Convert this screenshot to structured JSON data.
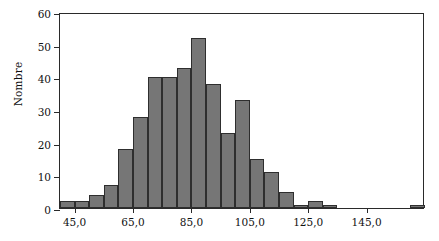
{
  "chart_data": {
    "type": "bar",
    "title": "",
    "subtitle": "",
    "xlabel": "",
    "ylabel": "Nombre",
    "grid": false,
    "legend": false,
    "legend_position": "none",
    "bar_color": "#767676",
    "bar_edge_color": "#2e2e2e",
    "axis_color": "#2a2a2a",
    "xlim": [
      40.0,
      165.0
    ],
    "ylim": [
      0,
      60
    ],
    "bin_width": 5.0,
    "y_ticks": [
      0,
      10,
      20,
      30,
      40,
      50,
      60
    ],
    "y_tick_labels": [
      "0",
      "10",
      "20",
      "30",
      "40",
      "50",
      "60"
    ],
    "x_ticks": [
      45.0,
      65.0,
      85.0,
      105.0,
      125.0,
      145.0
    ],
    "x_tick_labels": [
      "45,0",
      "65,0",
      "85,0",
      "105,0",
      "125,0",
      "145,0"
    ],
    "bin_edges": [
      40,
      45,
      50,
      55,
      60,
      65,
      70,
      75,
      80,
      85,
      90,
      95,
      100,
      105,
      110,
      115,
      120,
      125,
      130,
      135,
      140,
      145,
      150,
      155,
      160,
      165
    ],
    "categories": [
      "40-45",
      "45-50",
      "50-55",
      "55-60",
      "60-65",
      "65-70",
      "70-75",
      "75-80",
      "80-85",
      "85-90",
      "90-95",
      "95-100",
      "100-105",
      "105-110",
      "110-115",
      "115-120",
      "120-125",
      "125-130",
      "130-135",
      "135-140",
      "140-145",
      "145-150",
      "150-155",
      "155-160",
      "160-165"
    ],
    "values": [
      2,
      2,
      4,
      7,
      18,
      28,
      40,
      40,
      43,
      52,
      38,
      23,
      33,
      15,
      11,
      5,
      1,
      2,
      1,
      0,
      0,
      0,
      0,
      0,
      1
    ],
    "annotations": []
  }
}
